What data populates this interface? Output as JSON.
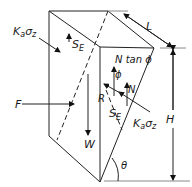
{
  "diagram": {
    "title": "",
    "labels": {
      "ka": "K",
      "ka_sub": "a",
      "sigma": "σ",
      "sigma_sub": "z",
      "se": "S",
      "se_sub": "E",
      "ntan": "N tan ϕ",
      "phi": "ϕ",
      "n": "N",
      "r": "R",
      "f": "F",
      "w": "W",
      "l": "L",
      "h": "H",
      "theta": "θ"
    },
    "elements": [
      {
        "id": "wedge-outline",
        "type": "prism"
      },
      {
        "id": "force-F",
        "label": "F",
        "direction": "right"
      },
      {
        "id": "force-W",
        "label": "W",
        "direction": "down"
      },
      {
        "id": "force-R",
        "label": "R"
      },
      {
        "id": "force-N",
        "label": "N"
      },
      {
        "id": "friction",
        "label": "N tan ϕ"
      },
      {
        "id": "shear-SE-left",
        "label": "S_E"
      },
      {
        "id": "shear-SE-right",
        "label": "S_E"
      },
      {
        "id": "pressure-left",
        "label": "K_a σ_z"
      },
      {
        "id": "pressure-right",
        "label": "K_a σ_z"
      },
      {
        "id": "dim-L",
        "label": "L"
      },
      {
        "id": "dim-H",
        "label": "H"
      },
      {
        "id": "angle-theta",
        "label": "θ"
      }
    ]
  }
}
